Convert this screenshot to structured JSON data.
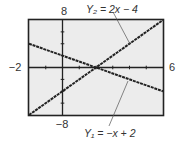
{
  "chart_data": {
    "type": "line",
    "title": "",
    "xlabel": "",
    "ylabel": "",
    "xlim": [
      -2,
      6
    ],
    "ylim": [
      -8,
      8
    ],
    "xscale": 1,
    "yscale": 2,
    "grid": false,
    "legend": "none",
    "tick_labels": {
      "xmin": "−2",
      "xmax": "6",
      "ymin": "−8",
      "ymax": "8"
    },
    "series": [
      {
        "name": "Y1",
        "equation": "Y₁ = −x + 2",
        "slope": -1,
        "intercept": 2,
        "x": [
          -2,
          6
        ],
        "y": [
          4,
          -4
        ]
      },
      {
        "name": "Y2",
        "equation": "Y₂ = 2x − 4",
        "slope": 2,
        "intercept": -4,
        "x": [
          -2,
          6
        ],
        "y": [
          -8,
          8
        ]
      }
    ],
    "annotations": [
      {
        "text": "Y₂ = 2x − 4",
        "target_series": "Y2",
        "position": "top"
      },
      {
        "text": "Y₁ = −x + 2",
        "target_series": "Y1",
        "position": "bottom"
      }
    ],
    "intersection": {
      "x": 2,
      "y": 0
    }
  },
  "colors": {
    "screen_bg": "#ececec",
    "frame": "#222222",
    "line": "#222222",
    "leader": "#555555",
    "text": "#333333"
  }
}
